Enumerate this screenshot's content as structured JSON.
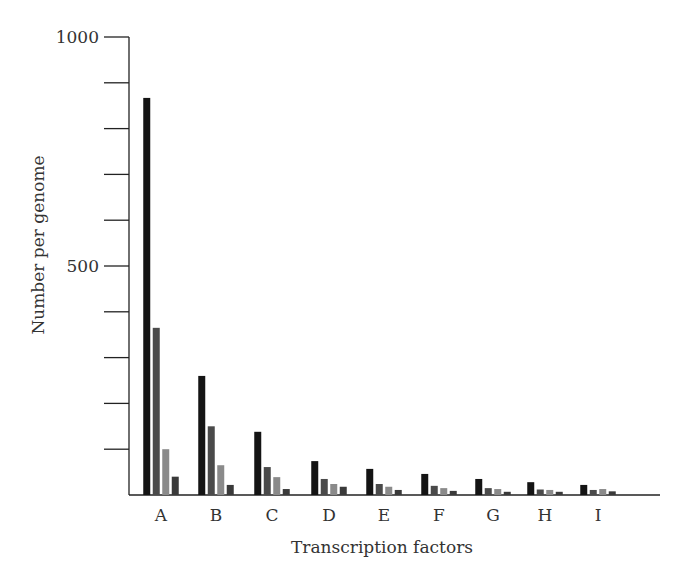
{
  "chart_data": {
    "type": "bar",
    "title": "",
    "xlabel": "Transcription factors",
    "ylabel": "Number per genome",
    "categories": [
      "A",
      "B",
      "C",
      "D",
      "E",
      "F",
      "G",
      "H",
      "I"
    ],
    "series": [
      {
        "name": "series-1",
        "color": "#141414",
        "values": [
          867,
          260,
          138,
          74,
          57,
          46,
          35,
          28,
          22
        ]
      },
      {
        "name": "series-2",
        "color": "#4a4a4a",
        "values": [
          365,
          150,
          61,
          35,
          24,
          20,
          15,
          12,
          11
        ]
      },
      {
        "name": "series-3",
        "color": "#8a8a8a",
        "values": [
          100,
          65,
          39,
          24,
          18,
          15,
          13,
          11,
          13
        ]
      },
      {
        "name": "series-4",
        "color": "#3a3a3a",
        "values": [
          40,
          22,
          13,
          18,
          11,
          9,
          7,
          7,
          8
        ]
      }
    ],
    "ylim": [
      0,
      1000
    ],
    "yticks_labeled": [
      500,
      1000
    ],
    "ytick_step": 100,
    "grid": false,
    "legend": null
  }
}
